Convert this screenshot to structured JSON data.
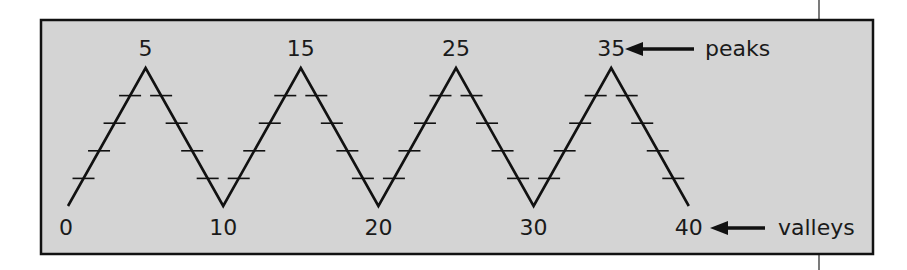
{
  "diagram": {
    "type": "zigzag-number-line",
    "colors": {
      "panel_bg": "#d4d4d4",
      "stroke": "#111111",
      "page_bg": "#ffffff"
    },
    "vertices": [
      {
        "value": "0",
        "kind": "valley"
      },
      {
        "value": "5",
        "kind": "peak"
      },
      {
        "value": "10",
        "kind": "valley"
      },
      {
        "value": "15",
        "kind": "peak"
      },
      {
        "value": "20",
        "kind": "valley"
      },
      {
        "value": "25",
        "kind": "peak"
      },
      {
        "value": "30",
        "kind": "valley"
      },
      {
        "value": "35",
        "kind": "peak"
      },
      {
        "value": "40",
        "kind": "valley"
      }
    ],
    "ticks_per_segment": 4,
    "annotations": {
      "peaks": "peaks",
      "valleys": "valleys"
    }
  }
}
